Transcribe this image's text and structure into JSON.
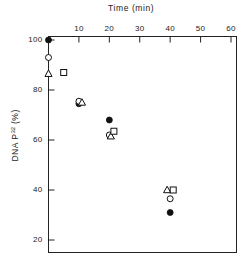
{
  "chart_data": {
    "type": "scatter",
    "title": "Time   (min)",
    "xlabel": "Time (min)",
    "ylabel": "DNA P32 (%)",
    "ylabel_prefix": "DNA  P",
    "ylabel_exponent": "32",
    "ylabel_suffix": "  (%)",
    "xlim": [
      0,
      64
    ],
    "ylim": [
      17,
      104
    ],
    "x_axis_position": "top",
    "xticks": [
      10,
      20,
      30,
      40,
      50,
      60
    ],
    "xtick_labels": [
      "10",
      "20",
      "30",
      "40",
      "50",
      "60"
    ],
    "yticks": [
      100,
      80,
      60,
      40,
      20
    ],
    "ytick_labels": [
      "100",
      "80",
      "60",
      "40",
      "20"
    ],
    "grid": false,
    "legend": "none",
    "series": [
      {
        "name": "filled-circle",
        "marker": "filled-circle",
        "x": [
          0,
          10,
          20,
          40
        ],
        "y": [
          100,
          74.5,
          68,
          31
        ]
      },
      {
        "name": "open-circle",
        "marker": "open-circle",
        "x": [
          0,
          10,
          20,
          40
        ],
        "y": [
          93,
          75.5,
          62,
          36.5
        ]
      },
      {
        "name": "open-triangle",
        "marker": "open-triangle",
        "x": [
          0,
          11,
          20.5,
          39
        ],
        "y": [
          86.5,
          75,
          61.5,
          40
        ]
      },
      {
        "name": "open-square",
        "marker": "open-square",
        "x": [
          5,
          21.5,
          41
        ],
        "y": [
          87,
          63.5,
          40
        ]
      }
    ]
  },
  "figure": {
    "background": "#ffffff",
    "axis_color": "#222222",
    "marker_color": "#111111"
  }
}
